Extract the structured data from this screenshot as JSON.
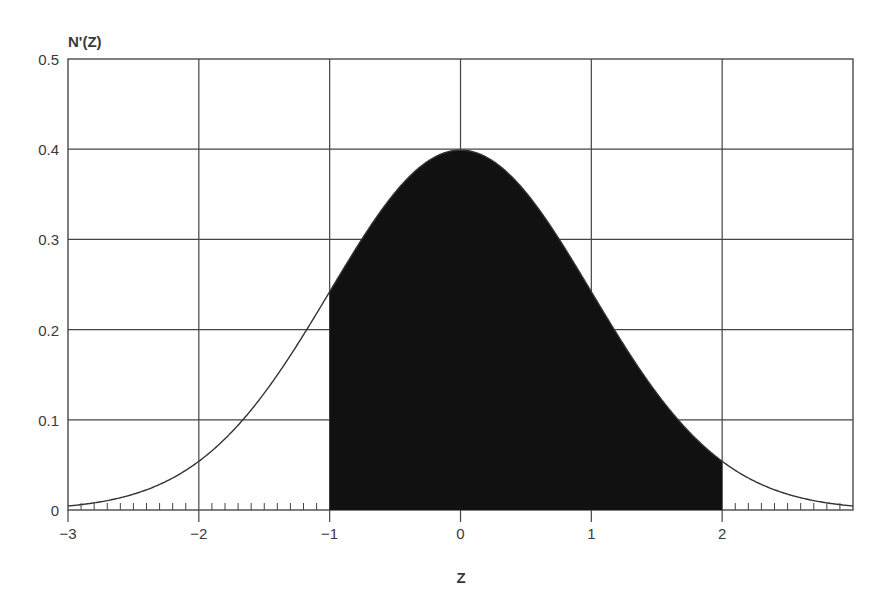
{
  "chart_data": {
    "type": "area",
    "title": "",
    "xlabel": "Z",
    "ylabel": "N'(Z)",
    "xlim": [
      -3,
      3
    ],
    "ylim": [
      0,
      0.5
    ],
    "grid": true,
    "x_ticks": [
      -3,
      -2,
      -1,
      0,
      1,
      2
    ],
    "x_tick_labels": [
      "−3",
      "−2",
      "−1",
      "0",
      "1",
      "2"
    ],
    "y_ticks": [
      0,
      0.1,
      0.2,
      0.3,
      0.4,
      0.5
    ],
    "y_tick_labels": [
      "0",
      "0.1",
      "0.2",
      "0.3",
      "0.4",
      "0.5"
    ],
    "series": [
      {
        "name": "Standard normal density N'(Z)",
        "x": [
          -3,
          -2.5,
          -2,
          -1.5,
          -1,
          -0.5,
          0,
          0.5,
          1,
          1.5,
          2,
          2.5,
          3
        ],
        "values": [
          0.0044,
          0.0175,
          0.054,
          0.1295,
          0.242,
          0.3521,
          0.3989,
          0.3521,
          0.242,
          0.1295,
          0.054,
          0.0175,
          0.0044
        ]
      }
    ],
    "shaded_region": {
      "from": -1,
      "to": 2,
      "color": "#111111"
    },
    "minor_ticks": "x-axis minor ticks every 0.1 outside shaded region",
    "legend": null
  }
}
